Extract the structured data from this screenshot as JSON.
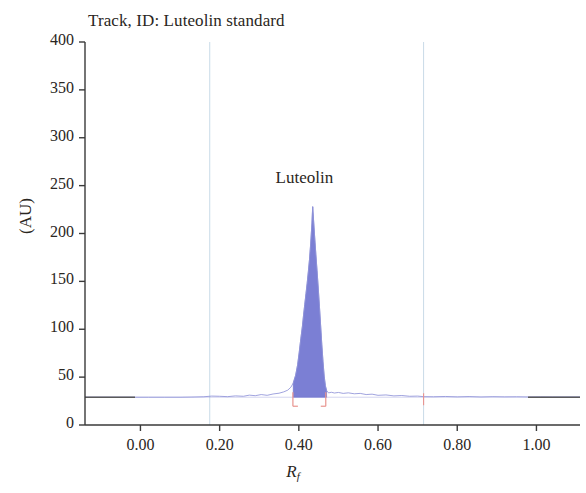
{
  "chart_data": {
    "type": "line",
    "title": "Track, ID: Luteolin standard",
    "xlabel": "R_f",
    "xlabel_base": "R",
    "xlabel_sub": "f",
    "ylabel": "(AU)",
    "xlim": [
      -0.14,
      1.11
    ],
    "ylim": [
      0,
      400
    ],
    "grid": false,
    "legend": false,
    "xticks": [
      "0.00",
      "0.20",
      "0.40",
      "0.60",
      "0.80",
      "1.00"
    ],
    "xtick_values": [
      0.0,
      0.2,
      0.4,
      0.6,
      0.8,
      1.0
    ],
    "yticks": [
      "0",
      "50",
      "100",
      "150",
      "200",
      "250",
      "300",
      "350",
      "400"
    ],
    "ytick_values": [
      0,
      50,
      100,
      150,
      200,
      250,
      300,
      350,
      400
    ],
    "baseline_value": 29,
    "annotations": [
      {
        "text": "Luteolin",
        "x": 0.455,
        "y": 258
      }
    ],
    "vertical_markers": [
      0.175,
      0.715
    ],
    "integration_marks": [
      0.385,
      0.468
    ],
    "colors": {
      "trace": "#8f93d8",
      "peak_fill": "#7b7fd4",
      "peak_edge": "#6f74cf",
      "integration_mark": "#e8948f",
      "vertical_marker": "#c9dbe8",
      "axis": "#3a3a3a",
      "text": "#2a2622",
      "baseline_segment": "#5a5a5a",
      "background": "#ffffff"
    },
    "series": [
      {
        "name": "Luteolin standard track",
        "peak_apex_rf": 0.435,
        "peak_apex_value": 228,
        "peak_start_rf": 0.385,
        "peak_end_rf": 0.468,
        "points": [
          [
            -0.14,
            29
          ],
          [
            -0.1,
            29
          ],
          [
            -0.06,
            29
          ],
          [
            -0.02,
            29
          ],
          [
            0.02,
            29
          ],
          [
            0.06,
            29
          ],
          [
            0.1,
            29
          ],
          [
            0.13,
            29.2
          ],
          [
            0.16,
            29.5
          ],
          [
            0.18,
            30.2
          ],
          [
            0.2,
            30.0
          ],
          [
            0.22,
            29.6
          ],
          [
            0.24,
            30.4
          ],
          [
            0.26,
            30.0
          ],
          [
            0.275,
            31.2
          ],
          [
            0.29,
            30.6
          ],
          [
            0.305,
            31.8
          ],
          [
            0.32,
            31.0
          ],
          [
            0.335,
            32.4
          ],
          [
            0.35,
            33.2
          ],
          [
            0.362,
            34.6
          ],
          [
            0.372,
            36.4
          ],
          [
            0.38,
            39.5
          ],
          [
            0.386,
            44.0
          ],
          [
            0.392,
            52.0
          ],
          [
            0.397,
            63.0
          ],
          [
            0.401,
            76.0
          ],
          [
            0.405,
            90.0
          ],
          [
            0.409,
            103.0
          ],
          [
            0.412,
            115.0
          ],
          [
            0.415,
            126.0
          ],
          [
            0.418,
            137.0
          ],
          [
            0.421,
            148.0
          ],
          [
            0.424,
            160.0
          ],
          [
            0.427,
            173.0
          ],
          [
            0.43,
            190.0
          ],
          [
            0.433,
            210.0
          ],
          [
            0.435,
            228.0
          ],
          [
            0.437,
            215.0
          ],
          [
            0.44,
            196.0
          ],
          [
            0.443,
            178.0
          ],
          [
            0.446,
            161.0
          ],
          [
            0.449,
            143.0
          ],
          [
            0.452,
            124.0
          ],
          [
            0.455,
            104.0
          ],
          [
            0.458,
            84.0
          ],
          [
            0.461,
            66.0
          ],
          [
            0.464,
            51.0
          ],
          [
            0.467,
            41.0
          ],
          [
            0.47,
            36.0
          ],
          [
            0.475,
            33.5
          ],
          [
            0.482,
            34.2
          ],
          [
            0.49,
            33.4
          ],
          [
            0.5,
            34.0
          ],
          [
            0.512,
            33.0
          ],
          [
            0.525,
            33.6
          ],
          [
            0.54,
            32.6
          ],
          [
            0.555,
            33.0
          ],
          [
            0.57,
            31.8
          ],
          [
            0.585,
            32.2
          ],
          [
            0.6,
            31.0
          ],
          [
            0.62,
            31.4
          ],
          [
            0.64,
            30.4
          ],
          [
            0.66,
            30.8
          ],
          [
            0.68,
            30.0
          ],
          [
            0.7,
            30.2
          ],
          [
            0.715,
            29.6
          ],
          [
            0.74,
            29.5
          ],
          [
            0.77,
            29.8
          ],
          [
            0.8,
            29.4
          ],
          [
            0.83,
            29.7
          ],
          [
            0.86,
            29.3
          ],
          [
            0.89,
            29.6
          ],
          [
            0.92,
            29.4
          ],
          [
            0.95,
            29.5
          ],
          [
            0.98,
            29.3
          ],
          [
            1.01,
            29.4
          ],
          [
            1.04,
            29.3
          ],
          [
            1.07,
            29.3
          ],
          [
            1.11,
            29.3
          ]
        ]
      }
    ]
  }
}
